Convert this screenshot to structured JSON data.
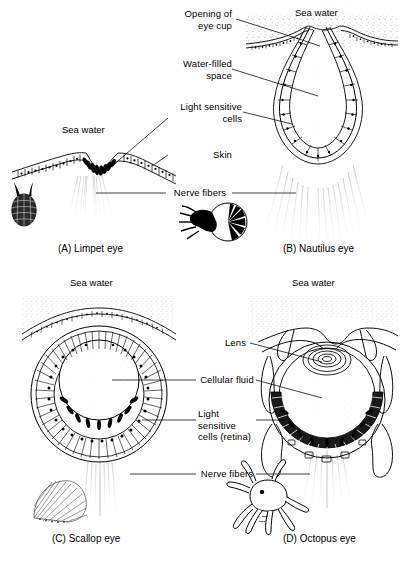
{
  "figure": {
    "background_color": "#ffffff",
    "ink_color": "#000000",
    "stipple_color": "#cfcfcf"
  },
  "panels": [
    {
      "id": "A",
      "caption": "(A) Limpet eye",
      "animal": "limpet",
      "sea_water_label": "Sea water",
      "structures": [
        "flat epithelium",
        "light sensitive cells",
        "skin",
        "nerve fibers"
      ]
    },
    {
      "id": "B",
      "caption": "(B) Nautilus eye",
      "animal": "nautilus",
      "sea_water_label": "Sea water",
      "structures": [
        "opening of eye cup",
        "water-filled space",
        "light sensitive cells",
        "nerve fibers"
      ]
    },
    {
      "id": "C",
      "caption": "(C) Scallop eye",
      "animal": "scallop",
      "sea_water_label": "Sea water",
      "structures": [
        "cellular fluid",
        "light sensitive cells (retina)",
        "nerve fibers"
      ]
    },
    {
      "id": "D",
      "caption": "(D) Octopus eye",
      "animal": "octopus",
      "sea_water_label": "Sea water",
      "structures": [
        "lens",
        "cellular fluid",
        "light sensitive cells (retina)",
        "nerve fibers"
      ]
    }
  ],
  "labels": {
    "opening_of_eye_cup": "Opening of\neye cup",
    "water_filled_space": "Water-filled\nspace",
    "light_sensitive_cells": "Light sensitive\ncells",
    "skin": "Skin",
    "nerve_fibers_top": "Nerve fibers",
    "sea_water_a": "Sea water",
    "sea_water_b": "Sea water",
    "sea_water_c": "Sea water",
    "sea_water_d": "Sea water",
    "lens": "Lens",
    "cellular_fluid": "Cellular fluid",
    "light_sensitive_cells_retina": "Light sensitive\ncells (retina)",
    "nerve_fibers_bottom": "Nerve fibers"
  },
  "captions": {
    "a": "(A) Limpet eye",
    "b": "(B) Nautilus eye",
    "c": "(C) Scallop eye",
    "d": "(D) Octopus eye"
  }
}
